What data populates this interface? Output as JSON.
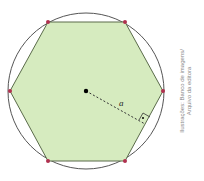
{
  "figure": {
    "shape": "regular-hexagon-inscribed-in-circle",
    "apothem_label": "a",
    "vertex_count": 6,
    "colors": {
      "hexagon_fill": "#d6ebbf",
      "hexagon_stroke": "#5a6b4a",
      "circle_stroke": "#555555",
      "vertex_dot": "#b0304f",
      "center_dot": "#000000",
      "apothem_line": "#333333"
    }
  },
  "credit": {
    "line1": "Ilustrações: Banco de imagens/",
    "line2": "Arquivo da editora"
  }
}
